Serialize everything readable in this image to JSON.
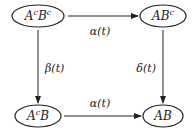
{
  "diagram": {
    "type": "state-transition",
    "colors": {
      "stroke": "#222222",
      "background": "#ffffff",
      "text": "#222222"
    },
    "nodes": [
      {
        "id": "AcBc",
        "base1": "A",
        "sup1": "c",
        "base2": "B",
        "sup2": "c",
        "label": "AᶜBᶜ",
        "cx": 38,
        "cy": 16
      },
      {
        "id": "ABc",
        "base1": "AB",
        "sup1": "c",
        "label": "ABᶜ",
        "cx": 163,
        "cy": 16
      },
      {
        "id": "AcB",
        "base1": "A",
        "sup1": "c",
        "base2": "B",
        "label": "AᶜB",
        "cx": 38,
        "cy": 116
      },
      {
        "id": "AB",
        "base1": "AB",
        "label": "AB",
        "cx": 163,
        "cy": 116
      }
    ],
    "edges": [
      {
        "from": "AcBc",
        "to": "ABc",
        "label": "α(t)"
      },
      {
        "from": "AcBc",
        "to": "AcB",
        "label": "β(t)"
      },
      {
        "from": "ABc",
        "to": "AB",
        "label": "δ(t)"
      },
      {
        "from": "AcB",
        "to": "AB",
        "label": "α(t)"
      }
    ]
  }
}
